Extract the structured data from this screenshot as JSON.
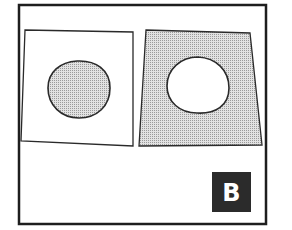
{
  "figure": {
    "panel_label": "B",
    "colors": {
      "frame": "#1e1e1e",
      "outline": "#2a2a2a",
      "fill_shaded": "#cfcfcf",
      "fill_white": "#ffffff",
      "badge_bg": "#2b2b2b",
      "badge_text": "#ffffff"
    },
    "left_panel": {
      "description": "white square with shaded circle",
      "square_fill": "white",
      "circle_fill": "shaded"
    },
    "right_panel": {
      "description": "shaded square with white circle",
      "square_fill": "shaded",
      "circle_fill": "white"
    }
  }
}
